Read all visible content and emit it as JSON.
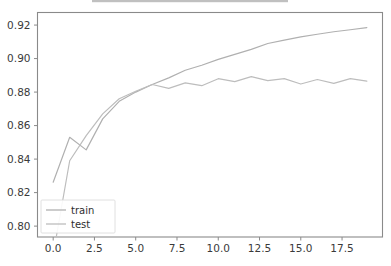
{
  "figure": {
    "title_visible_fragment": "",
    "background_color": "#ffffff",
    "width": 391,
    "height": 266
  },
  "chart_data": {
    "type": "line",
    "title": "",
    "xlabel": "",
    "ylabel": "",
    "xlim": [
      -0.95,
      19.95
    ],
    "ylim": [
      0.7935,
      0.9275
    ],
    "grid": false,
    "legend_position": "lower left",
    "xticks": [
      "0.0",
      "2.5",
      "5.0",
      "7.5",
      "10.0",
      "12.5",
      "15.0",
      "17.5"
    ],
    "xtick_values": [
      0.0,
      2.5,
      5.0,
      7.5,
      10.0,
      12.5,
      15.0,
      17.5
    ],
    "yticks": [
      "0.80",
      "0.82",
      "0.84",
      "0.86",
      "0.88",
      "0.90",
      "0.92"
    ],
    "ytick_values": [
      0.8,
      0.82,
      0.84,
      0.86,
      0.88,
      0.9,
      0.92
    ],
    "x": [
      0,
      1,
      2,
      3,
      4,
      5,
      6,
      7,
      8,
      9,
      10,
      11,
      12,
      13,
      14,
      15,
      16,
      17,
      18,
      19
    ],
    "series": [
      {
        "name": "train",
        "color": "#b0b0b0",
        "values": [
          0.8262,
          0.853,
          0.8455,
          0.864,
          0.8745,
          0.88,
          0.8845,
          0.8885,
          0.893,
          0.896,
          0.8995,
          0.9025,
          0.9055,
          0.909,
          0.911,
          0.913,
          0.9145,
          0.916,
          0.9172,
          0.9185
        ]
      },
      {
        "name": "test",
        "color": "#bdbdbd",
        "values": [
          0.783,
          0.839,
          0.854,
          0.867,
          0.876,
          0.8805,
          0.8845,
          0.8822,
          0.8855,
          0.8838,
          0.888,
          0.8862,
          0.8892,
          0.8868,
          0.888,
          0.8848,
          0.8875,
          0.8852,
          0.888,
          0.8865
        ]
      }
    ]
  },
  "legend": {
    "entries": [
      {
        "label": "train",
        "color": "#b0b0b0"
      },
      {
        "label": "test",
        "color": "#bdbdbd"
      }
    ]
  },
  "axes": {
    "spine_color": "#8a8a8a",
    "tick_color": "#8a8a8a",
    "label_color": "#3a3a3a"
  }
}
